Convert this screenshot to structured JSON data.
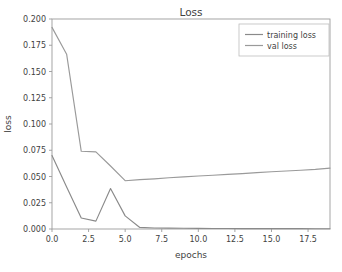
{
  "figure": {
    "title": "Loss",
    "caption_partial": ""
  },
  "legend": {
    "position": "upper-right",
    "entries": [
      {
        "label": "training loss",
        "color": "#8a8a8a"
      },
      {
        "label": "val loss",
        "color": "#9a9a9a"
      }
    ]
  },
  "colors": {
    "background": "#ffffff",
    "axis": "#9b9b9b",
    "text": "#3f3f3f",
    "training_loss": "#8a8a8a",
    "val_loss": "#9a9a9a",
    "legend_border": "#bdbdbd"
  },
  "axes": {
    "x_label": "epochs",
    "y_label": "loss",
    "x_ticks": [
      "0.0",
      "2.5",
      "5.0",
      "7.5",
      "10.0",
      "12.5",
      "15.0",
      "17.5"
    ],
    "y_ticks": [
      "0.000",
      "0.025",
      "0.050",
      "0.075",
      "0.100",
      "0.125",
      "0.150",
      "0.175",
      "0.200"
    ]
  },
  "chart_data": {
    "type": "line",
    "title": "Loss",
    "xlabel": "epochs",
    "ylabel": "loss",
    "xlim": [
      0,
      19
    ],
    "ylim": [
      0.0,
      0.2
    ],
    "grid": false,
    "legend_position": "upper right",
    "x": [
      0,
      1,
      2,
      3,
      4,
      5,
      6,
      7,
      8,
      9,
      10,
      11,
      12,
      13,
      14,
      15,
      16,
      17,
      18,
      19
    ],
    "series": [
      {
        "name": "training loss",
        "color": "#8a8a8a",
        "values": [
          0.07,
          0.04,
          0.0105,
          0.0075,
          0.0385,
          0.0125,
          0.0015,
          0.001,
          0.0008,
          0.0007,
          0.0006,
          0.0005,
          0.0005,
          0.0004,
          0.0004,
          0.0003,
          0.0003,
          0.0003,
          0.0002,
          0.0002
        ]
      },
      {
        "name": "val loss",
        "color": "#9a9a9a",
        "values": [
          0.192,
          0.1665,
          0.074,
          0.0735,
          0.06,
          0.046,
          0.047,
          0.0478,
          0.0488,
          0.0497,
          0.0505,
          0.0512,
          0.052,
          0.0528,
          0.0537,
          0.0545,
          0.0552,
          0.056,
          0.0568,
          0.058
        ]
      }
    ],
    "x_ticks": [
      0.0,
      2.5,
      5.0,
      7.5,
      10.0,
      12.5,
      15.0,
      17.5
    ],
    "y_ticks": [
      0.0,
      0.025,
      0.05,
      0.075,
      0.1,
      0.125,
      0.15,
      0.175,
      0.2
    ]
  }
}
